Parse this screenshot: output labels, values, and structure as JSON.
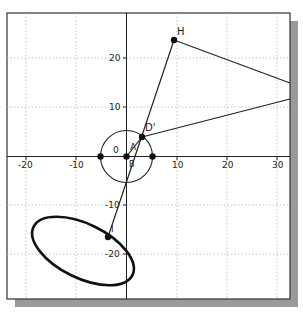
{
  "diagram": {
    "type": "coordinate-geometry-plot",
    "axes": {
      "x_ticks": [
        {
          "value": -20,
          "label": "-20"
        },
        {
          "value": -10,
          "label": "-10"
        },
        {
          "value": 10,
          "label": "10"
        },
        {
          "value": 20,
          "label": "20"
        },
        {
          "value": 30,
          "label": "30"
        }
      ],
      "y_ticks": [
        {
          "value": 20,
          "label": "20"
        },
        {
          "value": 10,
          "label": "10"
        },
        {
          "value": -10,
          "label": "-10"
        },
        {
          "value": -20,
          "label": "-20"
        }
      ],
      "origin_label": "0",
      "x_range": [
        -24,
        32
      ],
      "y_range": [
        -28.5,
        29
      ],
      "grid": true
    },
    "points": [
      {
        "id": "H",
        "label": "H",
        "x": 9.5,
        "y": 23.5
      },
      {
        "id": "D_prime",
        "label": "D'",
        "x": 3,
        "y": 4
      },
      {
        "id": "A",
        "label": "A",
        "x": 0,
        "y": 0
      },
      {
        "id": "I",
        "label": "I",
        "x": -3.6,
        "y": -16
      },
      {
        "id": "left",
        "label": "",
        "x": -5,
        "y": 0
      },
      {
        "id": "right",
        "label": "",
        "x": 5,
        "y": 0
      }
    ],
    "labels": {
      "H": "H",
      "D_prime": "D'",
      "zero": "0",
      "A": "A",
      "B": "B",
      "I": "I"
    },
    "circle": {
      "cx": 0,
      "cy": 0,
      "r": 5
    },
    "ellipse": {
      "cx": -8.8,
      "cy": -18.8,
      "rx": 10.9,
      "ry": 5.4,
      "rotation_deg": 26
    },
    "segments": [
      {
        "from": "I",
        "to": "H"
      },
      {
        "from": "H",
        "to_edge_y": 15
      },
      {
        "from": "D_prime",
        "to_edge_y": 11.6
      },
      {
        "from": "A",
        "to": "D_prime"
      }
    ]
  }
}
